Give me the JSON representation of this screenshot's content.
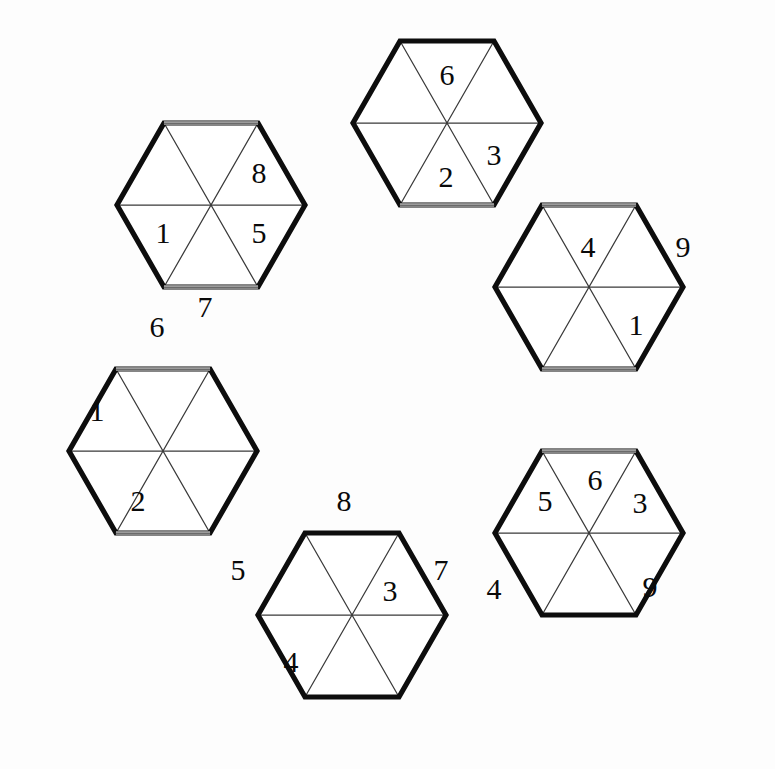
{
  "figure": {
    "background_color": "#fdfdfd",
    "outline_color": "#0d0d0d",
    "inner_line_color": "#3a3a3a",
    "digit_color": "#0a0a0a"
  },
  "geometry": {
    "unit_width": 94.5,
    "row_height": 82,
    "origin_x": 43,
    "origin_y": 43,
    "hexagon_centers": [
      {
        "name": "top-left",
        "x": 211,
        "y": 205
      },
      {
        "name": "top",
        "x": 447,
        "y": 123
      },
      {
        "name": "right",
        "x": 589,
        "y": 287
      },
      {
        "name": "bottom-right",
        "x": 589,
        "y": 533
      },
      {
        "name": "bottom",
        "x": 352,
        "y": 615
      },
      {
        "name": "left",
        "x": 163,
        "y": 451
      }
    ]
  },
  "hexagons": [
    {
      "id": "hex-top-left",
      "label": "Top-left hexagon",
      "center": {
        "x": 211,
        "y": 205
      },
      "cells": [
        {
          "slot": "upper-left",
          "value": ""
        },
        {
          "slot": "upper-right",
          "value": "8"
        },
        {
          "slot": "right",
          "value": "5"
        },
        {
          "slot": "lower-right",
          "value": ""
        },
        {
          "slot": "lower-left",
          "value": ""
        },
        {
          "slot": "left",
          "value": "1"
        }
      ]
    },
    {
      "id": "hex-top",
      "label": "Top hexagon",
      "center": {
        "x": 447,
        "y": 123
      },
      "cells": [
        {
          "slot": "upper-left",
          "value": ""
        },
        {
          "slot": "upper-right",
          "value": "6"
        },
        {
          "slot": "right",
          "value": "3"
        },
        {
          "slot": "lower-right",
          "value": ""
        },
        {
          "slot": "lower-left",
          "value": "2"
        },
        {
          "slot": "left",
          "value": ""
        }
      ]
    },
    {
      "id": "hex-right",
      "label": "Right hexagon",
      "center": {
        "x": 589,
        "y": 287
      },
      "cells": [
        {
          "slot": "upper-left",
          "value": "4"
        },
        {
          "slot": "upper-right",
          "value": "9"
        },
        {
          "slot": "right",
          "value": "1"
        },
        {
          "slot": "lower-right",
          "value": ""
        },
        {
          "slot": "lower-left",
          "value": ""
        },
        {
          "slot": "left",
          "value": ""
        }
      ]
    },
    {
      "id": "hex-bottom-right",
      "label": "Bottom-right hexagon",
      "center": {
        "x": 589,
        "y": 533
      },
      "cells": [
        {
          "slot": "upper-left",
          "value": "5"
        },
        {
          "slot": "upper-right",
          "value": "6"
        },
        {
          "slot": "right",
          "value": "3"
        },
        {
          "slot": "lower-right",
          "value": "9"
        },
        {
          "slot": "lower-left",
          "value": ""
        },
        {
          "slot": "left",
          "value": "4"
        }
      ]
    },
    {
      "id": "hex-bottom",
      "label": "Bottom hexagon",
      "center": {
        "x": 352,
        "y": 615
      },
      "cells": [
        {
          "slot": "upper-left",
          "value": ""
        },
        {
          "slot": "upper-right",
          "value": "8"
        },
        {
          "slot": "right",
          "value": "7"
        },
        {
          "slot": "lower-right",
          "value": "3"
        },
        {
          "slot": "lower-left",
          "value": "4"
        },
        {
          "slot": "left",
          "value": "5"
        }
      ]
    },
    {
      "id": "hex-left",
      "label": "Left hexagon",
      "center": {
        "x": 163,
        "y": 451
      },
      "cells": [
        {
          "slot": "upper-left",
          "value": "6"
        },
        {
          "slot": "upper-right",
          "value": "7"
        },
        {
          "slot": "right",
          "value": ""
        },
        {
          "slot": "lower-right",
          "value": ""
        },
        {
          "slot": "lower-left",
          "value": "2"
        },
        {
          "slot": "left",
          "value": "1"
        }
      ]
    }
  ],
  "digits": [
    {
      "id": "d-tl-8",
      "value": "8",
      "x": 259,
      "y": 176
    },
    {
      "id": "d-tl-5",
      "value": "5",
      "x": 259,
      "y": 236
    },
    {
      "id": "d-tl-1",
      "value": "1",
      "x": 163,
      "y": 236
    },
    {
      "id": "d-t-6",
      "value": "6",
      "x": 447,
      "y": 78
    },
    {
      "id": "d-t-3",
      "value": "3",
      "x": 494,
      "y": 158
    },
    {
      "id": "d-t-2",
      "value": "2",
      "x": 446,
      "y": 180
    },
    {
      "id": "d-r-4",
      "value": "4",
      "x": 588,
      "y": 250
    },
    {
      "id": "d-r-9",
      "value": "9",
      "x": 683,
      "y": 250
    },
    {
      "id": "d-r-1",
      "value": "1",
      "x": 636,
      "y": 328
    },
    {
      "id": "d-l-6",
      "value": "6",
      "x": 157,
      "y": 330
    },
    {
      "id": "d-l-7",
      "value": "7",
      "x": 205,
      "y": 310
    },
    {
      "id": "d-l-1",
      "value": "1",
      "x": 97,
      "y": 414
    },
    {
      "id": "d-l-2",
      "value": "2",
      "x": 138,
      "y": 504
    },
    {
      "id": "d-b-8",
      "value": "8",
      "x": 344,
      "y": 504
    },
    {
      "id": "d-b-5",
      "value": "5",
      "x": 238,
      "y": 573
    },
    {
      "id": "d-b-3",
      "value": "3",
      "x": 390,
      "y": 594
    },
    {
      "id": "d-b-7",
      "value": "7",
      "x": 441,
      "y": 573
    },
    {
      "id": "d-b-4",
      "value": "4",
      "x": 291,
      "y": 665
    },
    {
      "id": "d-br-4",
      "value": "4",
      "x": 494,
      "y": 592
    },
    {
      "id": "d-br-5",
      "value": "5",
      "x": 545,
      "y": 504
    },
    {
      "id": "d-br-6",
      "value": "6",
      "x": 595,
      "y": 483
    },
    {
      "id": "d-br-3",
      "value": "3",
      "x": 640,
      "y": 506
    },
    {
      "id": "d-br-9",
      "value": "9",
      "x": 650,
      "y": 590
    }
  ]
}
